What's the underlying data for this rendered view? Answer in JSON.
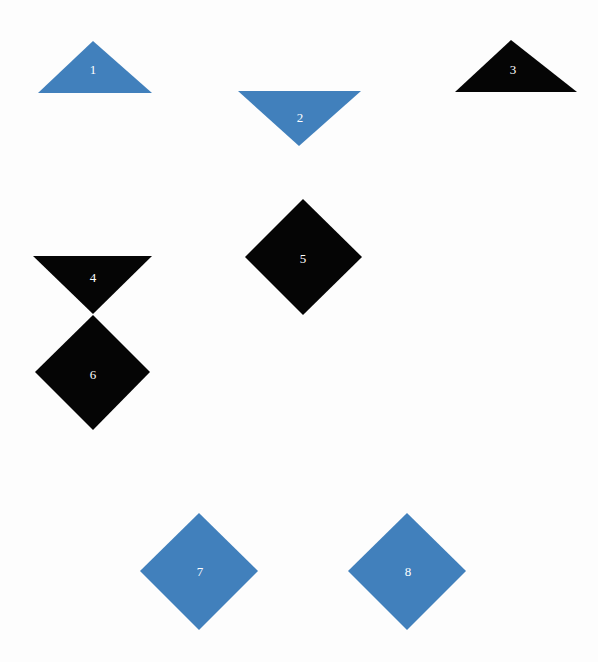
{
  "canvas": {
    "width": 598,
    "height": 662,
    "background_color": "#fdfdfd"
  },
  "palette": {
    "blue": "#4180bc",
    "black": "#050505",
    "label_color": "#ffffff"
  },
  "shapes": [
    {
      "id": "shape-1",
      "label": "1",
      "kind": "triangle-up",
      "color_name": "blue",
      "color": "#4180bc",
      "points": "93,41 152,93 38,93",
      "label_x": 93,
      "label_y": 69
    },
    {
      "id": "shape-2",
      "label": "2",
      "kind": "triangle-down",
      "color_name": "blue",
      "color": "#4180bc",
      "points": "238,91 361,91 299,146",
      "label_x": 300,
      "label_y": 117
    },
    {
      "id": "shape-3",
      "label": "3",
      "kind": "triangle-up",
      "color_name": "black",
      "color": "#050505",
      "points": "511,40 577,92 455,92",
      "label_x": 513,
      "label_y": 69
    },
    {
      "id": "shape-4",
      "label": "4",
      "kind": "triangle-down",
      "color_name": "black",
      "color": "#050505",
      "points": "33,256 152,256 93,314",
      "label_x": 93,
      "label_y": 277
    },
    {
      "id": "shape-5",
      "label": "5",
      "kind": "diamond",
      "color_name": "black",
      "color": "#050505",
      "points": "303,199 362,257 303,315 245,257",
      "label_x": 303,
      "label_y": 258
    },
    {
      "id": "shape-6",
      "label": "6",
      "kind": "diamond",
      "color_name": "black",
      "color": "#050505",
      "points": "93,315 150,372 93,430 35,372",
      "label_x": 93,
      "label_y": 374
    },
    {
      "id": "shape-7",
      "label": "7",
      "kind": "diamond",
      "color_name": "blue",
      "color": "#4180bc",
      "points": "199,513 258,571 199,630 140,571",
      "label_x": 200,
      "label_y": 571
    },
    {
      "id": "shape-8",
      "label": "8",
      "kind": "diamond",
      "color_name": "blue",
      "color": "#4180bc",
      "points": "407,513 466,571 407,630 348,571",
      "label_x": 408,
      "label_y": 571
    }
  ]
}
